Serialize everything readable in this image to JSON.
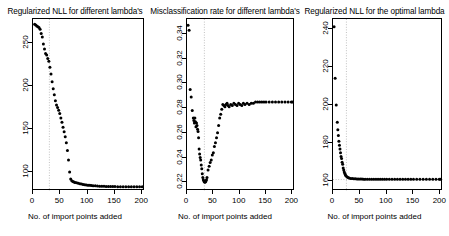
{
  "figure": {
    "background": "#ffffff",
    "point_color": "#000000",
    "axis_color": "#000000",
    "guide_color": "#999999"
  },
  "chart_data": [
    {
      "type": "scatter",
      "panel_index": 1,
      "title": "Regularized NLL for different lambda's",
      "xlabel": "No. of import points added",
      "ylabel": "",
      "xlim": [
        0,
        205
      ],
      "ylim": [
        78,
        278
      ],
      "xticks": [
        0,
        50,
        100,
        150,
        200
      ],
      "xtick_labels": [
        "0",
        "50",
        "100",
        "150",
        "200"
      ],
      "yticks": [
        100,
        150,
        200,
        250
      ],
      "ytick_labels": [
        "100",
        "150",
        "200",
        "250"
      ],
      "grid": false,
      "legend": "none",
      "vline": 30,
      "x": [
        3,
        5,
        7,
        9,
        11,
        13,
        15,
        17,
        19,
        21,
        23,
        25,
        27,
        29,
        31,
        33,
        35,
        37,
        39,
        41,
        43,
        45,
        47,
        49,
        51,
        53,
        55,
        57,
        59,
        61,
        63,
        65,
        67,
        69,
        71,
        73,
        75,
        77,
        80,
        83,
        86,
        89,
        92,
        95,
        98,
        101,
        104,
        107,
        110,
        114,
        118,
        122,
        126,
        130,
        134,
        138,
        142,
        146,
        150,
        155,
        160,
        165,
        170,
        175,
        180,
        185,
        190,
        195,
        200
      ],
      "y": [
        272,
        271,
        270,
        269,
        268,
        266,
        261,
        257,
        249,
        243,
        238,
        236,
        232,
        229,
        222,
        214,
        205,
        197,
        190,
        183,
        178,
        175,
        172,
        168,
        163,
        158,
        152,
        147,
        141,
        134,
        125,
        114,
        100,
        92,
        90,
        89,
        88.5,
        88,
        87.5,
        87,
        86.5,
        86,
        85.5,
        85.2,
        85,
        84.8,
        84.6,
        84.4,
        84.2,
        84,
        83.8,
        83.6,
        83.5,
        83.4,
        83.3,
        83.2,
        83.2,
        83.1,
        83.1,
        83,
        83,
        83,
        83,
        83,
        83,
        83,
        83,
        83,
        83
      ]
    },
    {
      "type": "scatter",
      "panel_index": 2,
      "title": "Misclassification rate for different lambda's",
      "xlabel": "No. of import points added",
      "ylabel": "",
      "xlim": [
        0,
        205
      ],
      "ylim": [
        0.213,
        0.352
      ],
      "xticks": [
        0,
        50,
        100,
        150,
        200
      ],
      "xtick_labels": [
        "0",
        "50",
        "100",
        "150",
        "200"
      ],
      "yticks": [
        0.22,
        0.24,
        0.26,
        0.28,
        0.3,
        0.32,
        0.34
      ],
      "ytick_labels": [
        "0.22",
        "0.24",
        "0.26",
        "0.28",
        "0.30",
        "0.32",
        "0.34"
      ],
      "grid": false,
      "legend": "none",
      "vline": 33,
      "x": [
        2,
        4,
        6,
        8,
        10,
        12,
        13,
        14,
        15,
        16,
        17,
        18,
        19,
        20,
        21,
        22,
        23,
        24,
        25,
        26,
        27,
        28,
        29,
        30,
        31,
        32,
        33,
        34,
        35,
        36,
        37,
        38,
        40,
        42,
        44,
        46,
        48,
        50,
        52,
        54,
        56,
        58,
        60,
        62,
        64,
        66,
        68,
        70,
        72,
        74,
        76,
        78,
        80,
        83,
        86,
        89,
        92,
        95,
        98,
        101,
        104,
        107,
        110,
        114,
        118,
        122,
        126,
        130,
        134,
        138,
        142,
        146,
        150,
        156,
        162,
        168,
        174,
        180,
        186,
        192,
        198,
        200
      ],
      "y": [
        0.347,
        0.343,
        0.295,
        0.289,
        0.278,
        0.272,
        0.27,
        0.268,
        0.272,
        0.269,
        0.265,
        0.268,
        0.266,
        0.263,
        0.261,
        0.256,
        0.247,
        0.243,
        0.24,
        0.238,
        0.234,
        0.231,
        0.227,
        0.224,
        0.222,
        0.221,
        0.2205,
        0.22,
        0.2205,
        0.221,
        0.222,
        0.224,
        0.23,
        0.233,
        0.236,
        0.238,
        0.242,
        0.244,
        0.249,
        0.252,
        0.256,
        0.26,
        0.266,
        0.272,
        0.275,
        0.279,
        0.283,
        0.282,
        0.281,
        0.283,
        0.284,
        0.282,
        0.281,
        0.283,
        0.282,
        0.284,
        0.283,
        0.282,
        0.284,
        0.283,
        0.282,
        0.284,
        0.283,
        0.284,
        0.283,
        0.284,
        0.284,
        0.285,
        0.285,
        0.285,
        0.285,
        0.285,
        0.285,
        0.285,
        0.285,
        0.285,
        0.285,
        0.285,
        0.285,
        0.285,
        0.285,
        0.285
      ]
    },
    {
      "type": "scatter",
      "panel_index": 3,
      "title": "Regularized NLL for the optimal lambda",
      "xlabel": "No. of import points added",
      "ylabel": "",
      "xlim": [
        0,
        205
      ],
      "ylim": [
        155,
        245
      ],
      "xticks": [
        0,
        50,
        100,
        150,
        200
      ],
      "xtick_labels": [
        "0",
        "50",
        "100",
        "150",
        "200"
      ],
      "yticks": [
        160,
        180,
        200,
        220,
        240
      ],
      "ytick_labels": [
        "160",
        "180",
        "200",
        "220",
        "240"
      ],
      "grid": false,
      "legend": "none",
      "vline": 25,
      "hline": 161,
      "x": [
        2,
        4,
        6,
        8,
        9,
        10,
        11,
        12,
        13,
        14,
        15,
        16,
        17,
        18,
        19,
        20,
        21,
        22,
        23,
        24,
        26,
        28,
        30,
        33,
        36,
        39,
        42,
        45,
        48,
        51,
        54,
        57,
        60,
        64,
        68,
        72,
        76,
        80,
        84,
        88,
        92,
        96,
        100,
        105,
        110,
        115,
        120,
        125,
        130,
        135,
        140,
        145,
        150,
        156,
        162,
        168,
        174,
        180,
        186,
        192,
        198,
        200
      ],
      "y": [
        241,
        214,
        200,
        191,
        187,
        184,
        181,
        179,
        177,
        175,
        173,
        172,
        170,
        169,
        167,
        166,
        165,
        164.2,
        163.5,
        163,
        162.4,
        162,
        161.8,
        161.6,
        161.5,
        161.4,
        161.35,
        161.3,
        161.28,
        161.25,
        161.22,
        161.2,
        161.2,
        161.18,
        161.16,
        161.15,
        161.14,
        161.13,
        161.12,
        161.11,
        161.1,
        161.1,
        161.1,
        161.1,
        161.1,
        161.1,
        161.1,
        161.1,
        161.1,
        161.1,
        161.1,
        161.1,
        161.1,
        161.1,
        161.1,
        161.1,
        161.1,
        161.1,
        161.1,
        161.1,
        161.1,
        161.1
      ]
    }
  ]
}
